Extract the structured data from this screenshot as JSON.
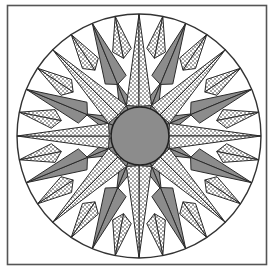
{
  "diagram": {
    "title": "Mariner's Compass quilt block",
    "canvas": {
      "width": 272,
      "height": 270
    },
    "frame": {
      "x": 7.5,
      "y": 5.5,
      "width": 259,
      "height": 259,
      "stroke": "#555555",
      "stroke_width": 1.6
    },
    "outer_circle": {
      "cx": 139,
      "cy": 136,
      "r": 122,
      "fill": "#ffffff",
      "stroke": "#333333",
      "stroke_width": 1.4
    },
    "center_circle": {
      "cx": 140,
      "cy": 136,
      "r": 29,
      "fill": "#8c8c8c",
      "stroke": "#222222",
      "stroke_width": 1.6
    },
    "colors": {
      "dotted_fill": "#ffffff",
      "dot": "#222222",
      "gray_fill": "#8c8c8c",
      "outline": "#2a2a2a",
      "background": "#ffffff"
    },
    "layers": [
      {
        "name": "inner-gray-star",
        "count": 8,
        "start_angle": 22.5,
        "tip_r": 58,
        "base_r": 26,
        "half_width_deg": 22.5,
        "fill": "gray"
      },
      {
        "name": "small-dotted-points",
        "count": 16,
        "start_angle": 11.25,
        "tip_r": 122,
        "base_r": 88,
        "half_width_deg": 6.2,
        "fill": "dotted"
      },
      {
        "name": "gray-points",
        "count": 8,
        "start_angle": 22.5,
        "tip_r": 122,
        "base_r": 62,
        "half_width_deg": 10.5,
        "fill": "gray"
      },
      {
        "name": "main-dotted-points",
        "count": 8,
        "start_angle": 0,
        "tip_r": 122,
        "base_r": 33,
        "half_width_deg": 22.5,
        "fill": "dotted"
      }
    ],
    "summary": {
      "total_points": 32,
      "main_points": 8,
      "gray_points": 8,
      "small_points": 16
    }
  }
}
